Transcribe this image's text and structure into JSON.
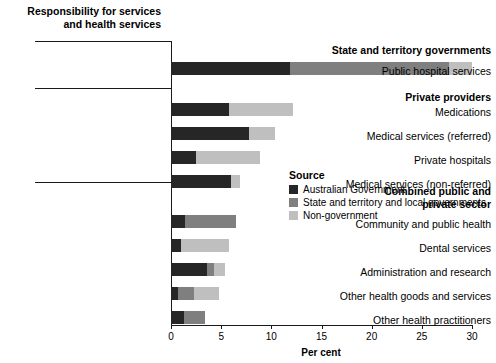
{
  "title": "Responsibility for services\nand health services",
  "axis": {
    "xlabel": "Per cent",
    "ticks": [
      "0",
      "5",
      "10",
      "15",
      "20",
      "25",
      "30"
    ]
  },
  "legend": {
    "title": "Source",
    "items": [
      {
        "label": "Australian Government",
        "color": "#262626"
      },
      {
        "label": "State and territory and local governments",
        "color": "#7f7f7f"
      },
      {
        "label": "Non-government",
        "color": "#bfbfbf"
      }
    ]
  },
  "groups": [
    {
      "label": "State and territory governments"
    },
    {
      "label": "Private providers"
    },
    {
      "label": "Combined public and\nprivate sector"
    }
  ],
  "chart_data": {
    "type": "bar",
    "orientation": "horizontal",
    "stacked": true,
    "title": "Responsibility for services and health services",
    "xlabel": "Per cent",
    "ylabel": "",
    "xlim": [
      0,
      30
    ],
    "xticks": [
      0,
      5,
      10,
      15,
      20,
      25,
      30
    ],
    "grid": false,
    "legend_position": "right-middle",
    "legend_title": "Source",
    "series": [
      {
        "name": "Australian Government",
        "color": "#262626",
        "values": [
          11.9,
          5.8,
          7.8,
          2.5,
          6.0,
          1.4,
          1.0,
          3.6,
          0.7,
          1.3
        ]
      },
      {
        "name": "State and territory and local governments",
        "color": "#7f7f7f",
        "values": [
          15.8,
          0.0,
          0.0,
          0.0,
          0.0,
          5.1,
          0.0,
          0.7,
          1.6,
          2.1
        ]
      },
      {
        "name": "Non-government",
        "color": "#bfbfbf",
        "values": [
          2.3,
          6.4,
          2.6,
          6.4,
          0.9,
          0.0,
          4.8,
          1.1,
          2.5,
          0.0
        ]
      }
    ],
    "categories": [
      "Public hospital services",
      "Medications",
      "Medical services (referred)",
      "Private hospitals",
      "Medical services (non-referred)",
      "Community and public health",
      "Dental services",
      "Administration and research",
      "Other health goods and services",
      "Other health practitioners"
    ],
    "totals": [
      30.0,
      12.2,
      10.4,
      8.9,
      6.9,
      6.5,
      5.8,
      5.4,
      4.8,
      3.4
    ],
    "category_groups": [
      "State and territory governments",
      "Private providers",
      "Private providers",
      "Private providers",
      "Private providers",
      "Combined public and private sector",
      "Combined public and private sector",
      "Combined public and private sector",
      "Combined public and private sector",
      "Combined public and private sector"
    ]
  }
}
